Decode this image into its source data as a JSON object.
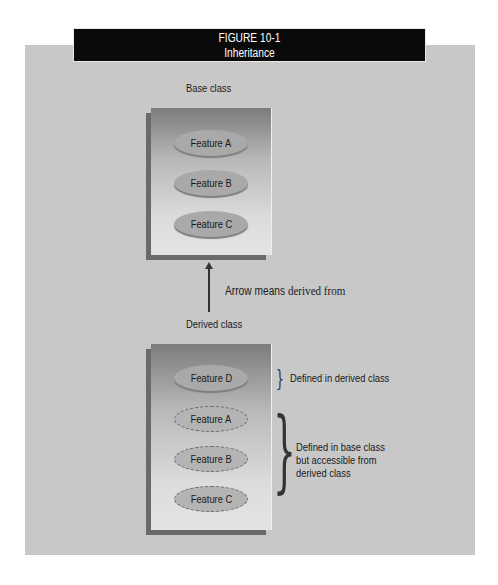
{
  "figure": {
    "number": "FIGURE 10-1",
    "title": "Inheritance"
  },
  "base": {
    "label": "Base class",
    "features": [
      "Feature A",
      "Feature B",
      "Feature C"
    ]
  },
  "arrow": {
    "bold_text": "Arrow means",
    "plain_text": "derived from"
  },
  "derived": {
    "label": "Derived class",
    "own_features": [
      "Feature D"
    ],
    "inherited_features": [
      "Feature A",
      "Feature B",
      "Feature C"
    ],
    "own_annotation": "Defined in derived class",
    "inherited_annotation_lines": [
      "Defined in base class",
      "but accessible from",
      "derived class"
    ]
  },
  "colors": {
    "title_bg": "#0a0a0a",
    "panel_bg": "#c8c8c8",
    "ellipse_fill": "#a9a9a9"
  }
}
